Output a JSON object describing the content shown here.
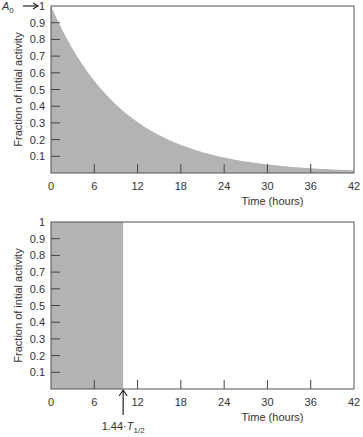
{
  "chart_data": [
    {
      "type": "area",
      "title": "",
      "xlabel": "Time (hours)",
      "ylabel": "Fraction of intial activity",
      "xlim": [
        0,
        42
      ],
      "ylim": [
        0,
        1
      ],
      "x_ticks": [
        "0",
        "6",
        "12",
        "18",
        "24",
        "30",
        "36",
        "42"
      ],
      "y_ticks": [
        "0.1",
        "0.2",
        "0.3",
        "0.4",
        "0.5",
        "0.6",
        "0.7",
        "0.8",
        "0.9",
        "1"
      ],
      "annotation": {
        "label": "A0",
        "subscript": "0",
        "base": "A",
        "at_y": 1
      },
      "series": [
        {
          "name": "exponential decay",
          "x": [
            0,
            3,
            6,
            9,
            12,
            15,
            18,
            21,
            24,
            27,
            30,
            33,
            36,
            39,
            42
          ],
          "values": [
            1.0,
            0.75,
            0.56,
            0.42,
            0.31,
            0.24,
            0.18,
            0.13,
            0.1,
            0.075,
            0.056,
            0.042,
            0.031,
            0.024,
            0.018
          ]
        }
      ],
      "fill_color": "#b3b3b3",
      "grid": false
    },
    {
      "type": "area",
      "title": "",
      "xlabel": "Time (hours)",
      "ylabel": "Fraction of intial activity",
      "xlim": [
        0,
        42
      ],
      "ylim": [
        0,
        1
      ],
      "x_ticks": [
        "0",
        "6",
        "12",
        "18",
        "24",
        "30",
        "36",
        "42"
      ],
      "y_ticks": [
        "0.1",
        "0.2",
        "0.3",
        "0.4",
        "0.5",
        "0.6",
        "0.7",
        "0.8",
        "0.9",
        "1"
      ],
      "annotation": {
        "label": "1.44·T1/2",
        "base": "1.44·T",
        "subscript": "1/2",
        "at_x": 10
      },
      "series": [
        {
          "name": "equivalent rectangle",
          "x": [
            0,
            10
          ],
          "values": [
            1,
            1
          ]
        }
      ],
      "fill_color": "#b3b3b3",
      "grid": false
    }
  ]
}
